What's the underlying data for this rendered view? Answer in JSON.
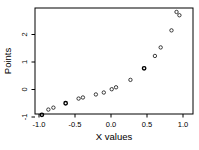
{
  "figure": {
    "background": "#ffffff",
    "frame_color": "#000000"
  },
  "chart_data": {
    "type": "scatter",
    "title": "",
    "xlabel": "X values",
    "ylabel": "Points",
    "xlim": [
      -1.06,
      1.14
    ],
    "ylim": [
      -1.15,
      2.95
    ],
    "x_ticks": [
      -1.0,
      -0.5,
      0.0,
      0.5,
      1.0
    ],
    "x_tick_labels": [
      "-1.0",
      "-0.5",
      "0.0",
      "0.5",
      "1.0"
    ],
    "y_ticks": [
      -1,
      0,
      1,
      2
    ],
    "y_tick_labels": [
      "-1",
      "0",
      "1",
      "2"
    ],
    "grid": false,
    "legend": "none",
    "marker": "open-circle",
    "point_color": "#000000",
    "points": [
      {
        "x": -0.96,
        "y": -0.92,
        "overplotted": true
      },
      {
        "x": -0.87,
        "y": -0.73,
        "overplotted": false
      },
      {
        "x": -0.8,
        "y": -0.66,
        "overplotted": false
      },
      {
        "x": -0.63,
        "y": -0.5,
        "overplotted": true
      },
      {
        "x": -0.45,
        "y": -0.33,
        "overplotted": false
      },
      {
        "x": -0.39,
        "y": -0.29,
        "overplotted": false
      },
      {
        "x": -0.21,
        "y": -0.18,
        "overplotted": false
      },
      {
        "x": -0.1,
        "y": -0.11,
        "overplotted": false
      },
      {
        "x": 0.01,
        "y": 0.01,
        "overplotted": false
      },
      {
        "x": 0.07,
        "y": 0.08,
        "overplotted": false
      },
      {
        "x": 0.27,
        "y": 0.35,
        "overplotted": false
      },
      {
        "x": 0.46,
        "y": 0.77,
        "overplotted": true
      },
      {
        "x": 0.61,
        "y": 1.22,
        "overplotted": false
      },
      {
        "x": 0.69,
        "y": 1.53,
        "overplotted": false
      },
      {
        "x": 0.84,
        "y": 2.15,
        "overplotted": false
      },
      {
        "x": 0.91,
        "y": 2.82,
        "overplotted": false
      },
      {
        "x": 0.95,
        "y": 2.7,
        "overplotted": false
      }
    ]
  }
}
